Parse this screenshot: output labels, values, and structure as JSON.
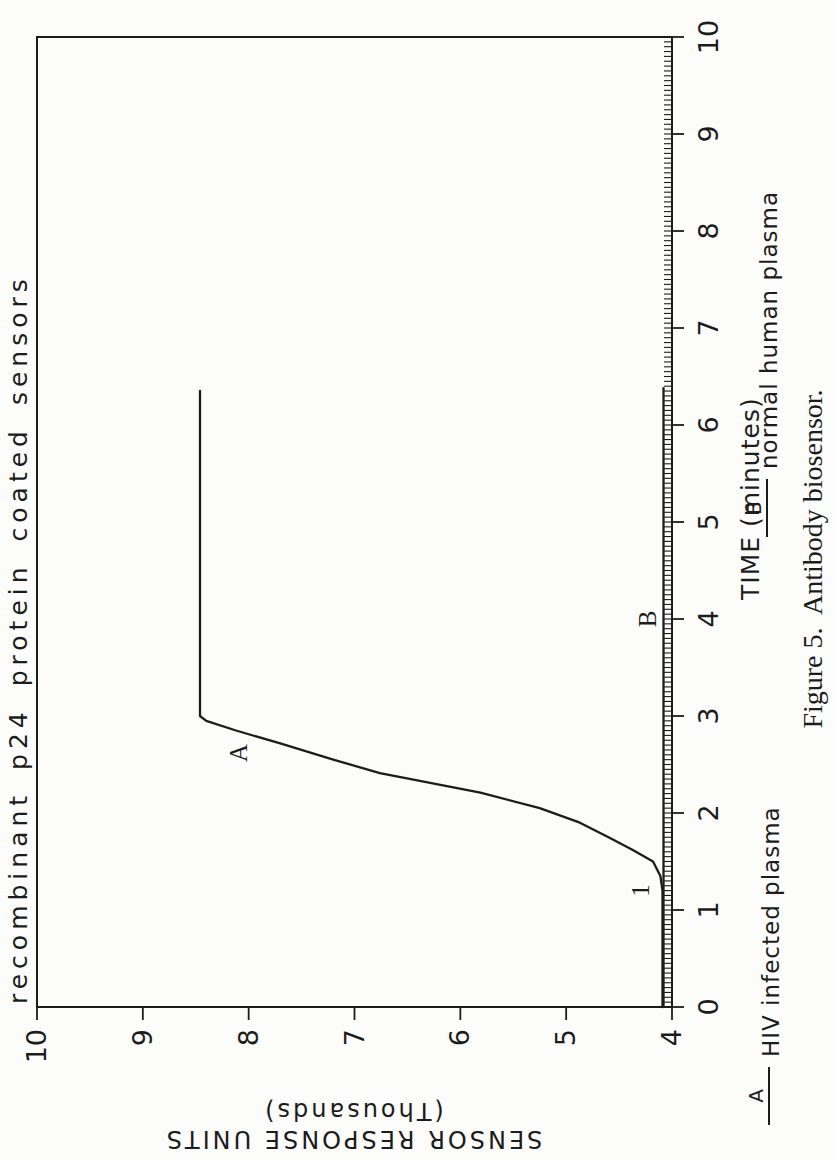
{
  "page": {
    "paper_color": "#fcfcfb",
    "ink_color": "#1c1c1c"
  },
  "figure": {
    "title": "recombinant p24 protein coated sensors",
    "caption": "Figure 5.  Antibody biosensor."
  },
  "axes": {
    "x_label": "TIME (minutes)",
    "y_label_line1": "SENSOR RESPONSE UNITS",
    "y_label_line2": "(Thousands)"
  },
  "legend": {
    "a_key": "A",
    "a_label": "HIV infected plasma",
    "b_key": "B",
    "b_label": "normal human plasma"
  },
  "chart_data": {
    "type": "line",
    "title": "recombinant p24 protein coated sensors",
    "xlabel": "TIME (minutes)",
    "ylabel": "SENSOR RESPONSE UNITS (Thousands)",
    "xlim": [
      0,
      10
    ],
    "ylim": [
      4,
      10
    ],
    "x_ticks": [
      0,
      1,
      2,
      3,
      4,
      5,
      6,
      7,
      8,
      9,
      10
    ],
    "y_ticks": [
      4,
      5,
      6,
      7,
      8,
      9,
      10
    ],
    "x_minor_step": 0.05,
    "grid": false,
    "orientation": "figure rotated 90deg counterclockwise on page",
    "series": [
      {
        "name": "A",
        "label": "HIV infected plasma",
        "points": [
          [
            0,
            4.09
          ],
          [
            0.6,
            4.09
          ],
          [
            1.2,
            4.09
          ],
          [
            1.35,
            4.11
          ],
          [
            1.5,
            4.18
          ],
          [
            1.62,
            4.37
          ],
          [
            1.75,
            4.6
          ],
          [
            1.9,
            4.87
          ],
          [
            2.05,
            5.25
          ],
          [
            2.21,
            5.81
          ],
          [
            2.41,
            6.76
          ],
          [
            2.55,
            7.2
          ],
          [
            2.72,
            7.71
          ],
          [
            2.85,
            8.12
          ],
          [
            2.95,
            8.4
          ],
          [
            3.0,
            8.46
          ],
          [
            6.35,
            8.46
          ]
        ]
      },
      {
        "name": "B",
        "label": "normal human plasma",
        "points": [
          [
            0,
            4.08
          ],
          [
            6.38,
            4.08
          ]
        ]
      }
    ],
    "annotations": [
      {
        "text": "1",
        "x": 1.2,
        "y": 4.3
      },
      {
        "text": "A",
        "x": 2.62,
        "y": 8.1
      },
      {
        "text": "B",
        "x": 4.0,
        "y": 4.24
      }
    ]
  }
}
